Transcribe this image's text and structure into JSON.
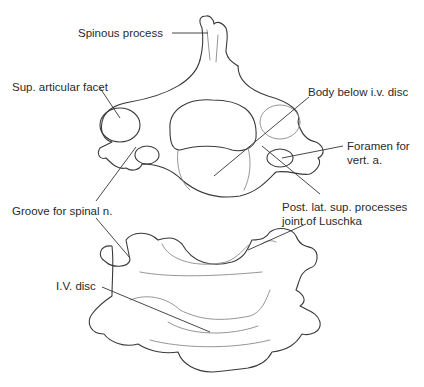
{
  "figure": {
    "labels": {
      "spinous_process": "Spinous process",
      "sup_articular_facet": "Sup. articular facet",
      "body_below_iv_disc": "Body below i.v. disc",
      "foramen_line1": "Foramen for",
      "foramen_line2": "vert. a.",
      "groove_spinal_n": "Groove for spinal n.",
      "post_lat_line1": "Post. lat. sup. processes",
      "post_lat_line2": "joint of Luschka",
      "iv_disc": "I.V. disc"
    },
    "colors": {
      "line": "#3a3a3a",
      "text": "#2a2a2a",
      "background": "#ffffff"
    }
  }
}
